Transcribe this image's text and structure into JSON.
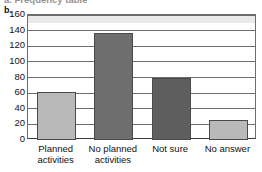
{
  "clipped_caption": "a. Frequency table",
  "part_label": "b.",
  "chart_data": {
    "type": "bar",
    "title": "",
    "xlabel": "",
    "ylabel": "",
    "categories": [
      "Planned\nactivities",
      "No planned\nactivities",
      "Not sure",
      "No answer"
    ],
    "values": [
      62,
      137,
      79,
      25
    ],
    "bar_colors": [
      "#b9b9b9",
      "#6e6e6e",
      "#5e5e5e",
      "#b9b9b9"
    ],
    "ylim": [
      0,
      160
    ],
    "yticks": [
      0,
      20,
      40,
      60,
      80,
      100,
      120,
      140,
      160
    ],
    "ytick_labels": [
      "0",
      "20",
      "40",
      "60",
      "80",
      "100",
      "120",
      "140",
      "160"
    ],
    "grid": true,
    "legend": "none",
    "plot_background": "#ffffff",
    "gridline_color": "#6d6d6d",
    "axis_color": "#3a3a3a"
  }
}
